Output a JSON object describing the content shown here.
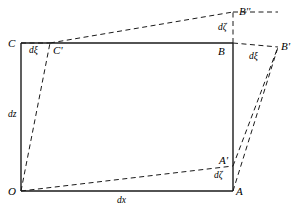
{
  "figure": {
    "type": "geometric-diagram",
    "background_color": "#ffffff",
    "line_color": "#1a1a1a",
    "width": 299,
    "height": 211
  },
  "rect": {
    "origin_label": "O",
    "x_left": 21,
    "x_right": 233,
    "y_top": 43,
    "y_bottom": 191
  },
  "vertices": [
    {
      "id": "O",
      "label": "O",
      "x": 21,
      "y": 191,
      "label_x": 8,
      "label_y": 186
    },
    {
      "id": "A",
      "label": "A",
      "x": 233,
      "y": 191,
      "label_x": 236,
      "label_y": 186
    },
    {
      "id": "B",
      "label": "B",
      "x": 233,
      "y": 43,
      "label_x": 218,
      "label_y": 46
    },
    {
      "id": "C",
      "label": "C",
      "x": 21,
      "y": 43,
      "label_x": 8,
      "label_y": 38
    }
  ],
  "displaced_points": [
    {
      "id": "Ap",
      "label": "A'",
      "x": 233,
      "y": 166,
      "label_x": 219,
      "label_y": 155
    },
    {
      "id": "Bp",
      "label": "B'",
      "x": 278,
      "y": 47,
      "label_x": 281,
      "label_y": 41
    },
    {
      "id": "Bpp",
      "label": "B''",
      "x": 233,
      "y": 12,
      "label_x": 239,
      "label_y": 6
    },
    {
      "id": "Cp",
      "label": "C'",
      "x": 50,
      "y": 43,
      "label_x": 53,
      "label_y": 45
    }
  ],
  "dimension_labels": [
    {
      "id": "dx",
      "text": "dx",
      "x": 117,
      "y": 196
    },
    {
      "id": "dz",
      "text": "dz",
      "x": 8,
      "y": 110
    },
    {
      "id": "dxi-top",
      "text": "dξ",
      "x": 29,
      "y": 46
    },
    {
      "id": "dxi-right",
      "text": "dξ",
      "x": 249,
      "y": 52
    },
    {
      "id": "dzeta-top",
      "text": "dζ",
      "x": 218,
      "y": 23
    },
    {
      "id": "dzeta-bot",
      "text": "dζ",
      "x": 214,
      "y": 171
    }
  ],
  "solid_edges": [
    {
      "id": "edge-OA",
      "x1": 21,
      "y1": 191,
      "x2": 233,
      "y2": 191
    },
    {
      "id": "edge-AB",
      "x1": 233,
      "y1": 191,
      "x2": 233,
      "y2": 43
    },
    {
      "id": "edge-BC",
      "x1": 233,
      "y1": 43,
      "x2": 21,
      "y2": 43
    },
    {
      "id": "edge-CO",
      "x1": 21,
      "y1": 43,
      "x2": 21,
      "y2": 191
    }
  ],
  "dashed_edges": [
    {
      "id": "dash-O-Cp",
      "x1": 21,
      "y1": 191,
      "x2": 50,
      "y2": 43
    },
    {
      "id": "dash-Cp-Bpp",
      "x1": 50,
      "y1": 43,
      "x2": 233,
      "y2": 12
    },
    {
      "id": "dash-C-Cp",
      "x1": 21,
      "y1": 43,
      "x2": 50,
      "y2": 43
    },
    {
      "id": "dash-O-Ap",
      "x1": 21,
      "y1": 191,
      "x2": 233,
      "y2": 166
    },
    {
      "id": "dash-Ap-Bp",
      "x1": 233,
      "y1": 166,
      "x2": 278,
      "y2": 47
    },
    {
      "id": "dash-A-Bp",
      "x1": 233,
      "y1": 191,
      "x2": 278,
      "y2": 47
    },
    {
      "id": "dash-B-Bp",
      "x1": 233,
      "y1": 43,
      "x2": 278,
      "y2": 47
    },
    {
      "id": "dash-B-Bpp",
      "x1": 233,
      "y1": 43,
      "x2": 233,
      "y2": 12
    },
    {
      "id": "dash-Bpp-Bp",
      "x1": 233,
      "y1": 12,
      "x2": 278,
      "y2": 12
    }
  ]
}
